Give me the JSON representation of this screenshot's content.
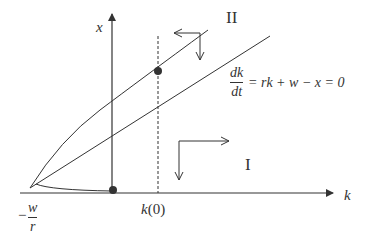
{
  "diagram": {
    "type": "phase-diagram",
    "axes": {
      "horizontal_label": "k",
      "vertical_label": "x"
    },
    "labels": {
      "region_upper": "II",
      "region_lower": "I",
      "intercept_minus": "−",
      "intercept_num": "w",
      "intercept_den": "r",
      "k0": "k(0)",
      "nullcline_num": "dk",
      "nullcline_den": "dt",
      "nullcline_rhs": "= rk + w − x = 0"
    },
    "elements": {
      "nullcline": "straight line dk/dt = 0",
      "saddle_path": "curved trajectory",
      "initial_condition": "dashed vertical line at k(0)",
      "points": [
        "dot on curve at k(0)",
        "dot on k-axis at x-axis origin"
      ],
      "direction_arrows": [
        "region II: left and down",
        "region I: right and down"
      ]
    },
    "colors": {
      "line": "#333333",
      "dot": "#333333"
    }
  }
}
